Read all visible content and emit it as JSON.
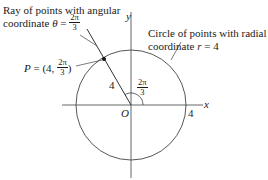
{
  "diagram": {
    "type": "polar-coordinates",
    "labels": {
      "ray_line1": "Ray of points with angular",
      "ray_line2_prefix": "coordinate ",
      "theta": "θ",
      "equals": " = ",
      "frac_num": "2π",
      "frac_den": "3",
      "circle_line1": "Circle of points with radial",
      "circle_line2_prefix": "coordinate ",
      "r_var": "r",
      "circle_line2_suffix": " = 4",
      "point_P": "P",
      "point_eq": " = ",
      "point_open": "(4, ",
      "point_close": ")",
      "radius_label": "4",
      "angle_num": "2π",
      "angle_den": "3",
      "origin": "O",
      "x_axis": "x",
      "y_axis": "y",
      "x_tick": "4"
    },
    "geometry": {
      "origin_px": [
        131,
        105
      ],
      "radius_px": 55,
      "radius": 4,
      "angle": "2π/3",
      "point": {
        "r": 4,
        "theta": "2π/3"
      }
    },
    "colors": {
      "stroke": "#1a1a1a",
      "axis": "#555555"
    }
  }
}
